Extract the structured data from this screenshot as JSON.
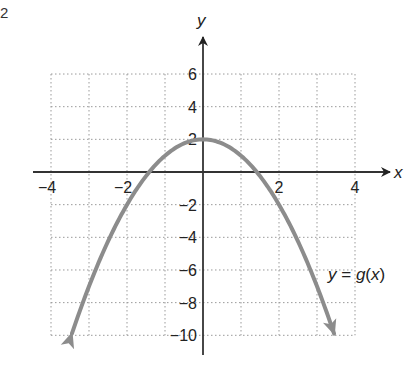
{
  "figure_number": "2",
  "chart_data": {
    "type": "line",
    "title": "",
    "xlabel": "x",
    "ylabel": "y",
    "xlim": [
      -4,
      4
    ],
    "ylim": [
      -10,
      6
    ],
    "x_ticks": [
      -4,
      -2,
      2,
      4
    ],
    "y_ticks": [
      6,
      4,
      2,
      -2,
      -4,
      -6,
      -8,
      -10
    ],
    "x_tick_labels": [
      "−4",
      "−2",
      "2",
      "4"
    ],
    "y_tick_labels": [
      "6",
      "4",
      "2",
      "−2",
      "−4",
      "−6",
      "−8",
      "−10"
    ],
    "grid": true,
    "grid_style": "dotted",
    "grid_x_step": 1,
    "grid_y_step": 2,
    "series": [
      {
        "name": "y = g(x)",
        "function": "g(x) = -x^2 + 2",
        "vertex": [
          0,
          2
        ],
        "x_intercepts": [
          -1.41,
          1.41
        ],
        "y_intercept": 2,
        "arrows_at_ends": true,
        "x": [
          -3.5,
          -3,
          -2,
          -1,
          0,
          1,
          2,
          3,
          3.5
        ],
        "values": [
          -10.25,
          -7,
          -2,
          1,
          2,
          1,
          -2,
          -7,
          -10.25
        ],
        "color": "#8c8c8c"
      }
    ],
    "annotations": [
      {
        "text": "y = g(x)",
        "x": 3.3,
        "y": -7
      }
    ]
  },
  "labels": {
    "x_axis": "x",
    "y_axis": "y",
    "function": "y = g(x)"
  }
}
